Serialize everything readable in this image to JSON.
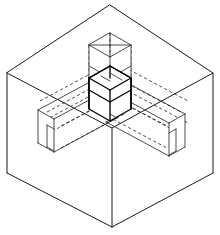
{
  "figure": {
    "title": "Isometric cube with internal orthogonal cross solid",
    "kind": "isometric-technical-drawing",
    "canvas": {
      "width": 220,
      "height": 235,
      "background": "#ffffff"
    },
    "line_styles": {
      "visible_edge": {
        "color": "#1a1a1a",
        "width": 1,
        "name": "solid"
      },
      "hidden_edge": {
        "color": "#2b2b2b",
        "width": 0.85,
        "name": "dashed",
        "dash": "3.1 2.6"
      },
      "core_edge": {
        "color": "#000000",
        "width": 1.35,
        "name": "heavy-solid"
      }
    },
    "parts": [
      {
        "name": "outer-bounding-cube",
        "style": "solid",
        "description": "large isometric cube enclosing the figure"
      },
      {
        "name": "central-cube-core",
        "style": "heavy-solid",
        "description": "small cube at the centre where all arms meet"
      },
      {
        "name": "vertical-arm-up",
        "style": "solid-with-hidden",
        "description": "square column rising from the centre toward the top"
      },
      {
        "name": "horizontal-arm-left",
        "style": "solid-with-hidden",
        "description": "square bar extending to the lower-left end face"
      },
      {
        "name": "horizontal-arm-right",
        "style": "solid-with-hidden",
        "description": "square bar extending to the lower-right end face"
      }
    ],
    "geometry": {
      "outer_cube_vertices": {
        "top": [
          110,
          5
        ],
        "left": [
          7,
          73
        ],
        "right": [
          213,
          73
        ],
        "center_front": [
          112,
          128
        ],
        "bottom": [
          112,
          227
        ],
        "left_bottom": [
          7,
          173
        ],
        "right_bottom": [
          213,
          173
        ]
      },
      "center_cluster": {
        "x": 110,
        "y": 97
      },
      "left_arm_end": {
        "x": 38,
        "y": 128
      },
      "right_arm_end": {
        "x": 185,
        "y": 132
      },
      "column_top": {
        "x": 110,
        "y": 33
      }
    }
  }
}
